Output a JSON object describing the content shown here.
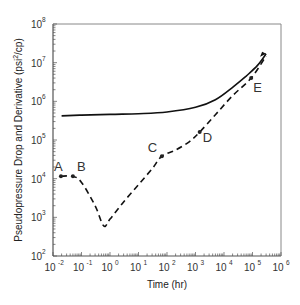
{
  "chart_data": {
    "type": "line",
    "title": "",
    "xlabel": "Time (hr)",
    "ylabel": "Pseudopressure Drop and Derivative (psi²/cp)",
    "ylabel_parts": {
      "main": "Pseudopressure Drop and Derivative (psi",
      "sup": "2",
      "tail": "/cp)"
    },
    "x_scale": "log",
    "y_scale": "log",
    "xlim": [
      0.01,
      1000000
    ],
    "ylim": [
      100,
      100000000
    ],
    "x_ticks": [
      {
        "base": "10",
        "exp": "-2"
      },
      {
        "base": "10",
        "exp": "-1"
      },
      {
        "base": "10",
        "exp": "0"
      },
      {
        "base": "10",
        "exp": "1"
      },
      {
        "base": "10",
        "exp": "2"
      },
      {
        "base": "10",
        "exp": "3"
      },
      {
        "base": "10",
        "exp": "4"
      },
      {
        "base": "10",
        "exp": "5"
      },
      {
        "base": "10",
        "exp": "6"
      }
    ],
    "y_ticks": [
      {
        "base": "10",
        "exp": "2"
      },
      {
        "base": "10",
        "exp": "3"
      },
      {
        "base": "10",
        "exp": "4"
      },
      {
        "base": "10",
        "exp": "5"
      },
      {
        "base": "10",
        "exp": "6"
      },
      {
        "base": "10",
        "exp": "7"
      },
      {
        "base": "10",
        "exp": "8"
      }
    ],
    "grid": false,
    "legend": null,
    "series": [
      {
        "name": "Pseudopressure Drop",
        "style": "solid",
        "color": "#111111",
        "x": [
          0.02,
          0.1,
          1,
          10,
          100,
          1000,
          5000,
          20000,
          60000,
          150000,
          300000
        ],
        "y": [
          420000,
          440000,
          460000,
          480000,
          530000,
          700000,
          1100000,
          2300000,
          4500000,
          8500000,
          17000000
        ]
      },
      {
        "name": "Pseudopressure Derivative",
        "style": "dashed",
        "color": "#111111",
        "x": [
          0.019,
          0.05,
          0.1,
          0.3,
          0.6,
          1,
          3,
          10,
          30,
          66,
          200,
          600,
          1400,
          5000,
          20000,
          90000,
          300000
        ],
        "y": [
          11500,
          11500,
          8000,
          2000,
          600,
          900,
          2500,
          7000,
          18000,
          38000,
          55000,
          90000,
          160000,
          450000,
          1400000,
          4000000,
          15000000
        ]
      }
    ],
    "annotations": [
      {
        "label": "A",
        "x": 0.019,
        "y": 11500
      },
      {
        "label": "B",
        "x": 0.05,
        "y": 11500
      },
      {
        "label": "C",
        "x": 66,
        "y": 38000
      },
      {
        "label": "D",
        "x": 1400,
        "y": 160000
      },
      {
        "label": "E",
        "x": 90000,
        "y": 4000000
      }
    ]
  }
}
